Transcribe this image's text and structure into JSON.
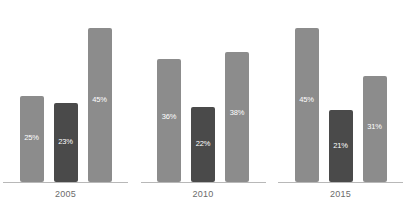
{
  "chart_data": {
    "type": "bar",
    "title": "",
    "subtitle": "",
    "xlabel": "",
    "ylabel": "",
    "ylim": [
      0,
      50
    ],
    "grid": false,
    "legend_position": "none",
    "categories": [
      "2005",
      "2010",
      "2015"
    ],
    "series": [
      {
        "name": "Series 1",
        "color": "#8c8c8c",
        "values": [
          25,
          36,
          45
        ]
      },
      {
        "name": "Series 2",
        "color": "#4a4a4a",
        "values": [
          23,
          22,
          21
        ]
      },
      {
        "name": "Series 3",
        "color": "#8c8c8c",
        "values": [
          45,
          38,
          31
        ]
      }
    ],
    "data_labels": [
      [
        "25%",
        "23%",
        "45%"
      ],
      [
        "36%",
        "22%",
        "38%"
      ],
      [
        "45%",
        "21%",
        "31%"
      ]
    ]
  },
  "groups": [
    {
      "year": "2005",
      "bars": [
        {
          "label": "25%",
          "value": 25,
          "color": "#8c8c8c",
          "tone": "light"
        },
        {
          "label": "23%",
          "value": 23,
          "color": "#4a4a4a",
          "tone": "dark"
        },
        {
          "label": "45%",
          "value": 45,
          "color": "#8c8c8c",
          "tone": "light"
        }
      ]
    },
    {
      "year": "2010",
      "bars": [
        {
          "label": "36%",
          "value": 36,
          "color": "#8c8c8c",
          "tone": "light"
        },
        {
          "label": "22%",
          "value": 22,
          "color": "#4a4a4a",
          "tone": "dark"
        },
        {
          "label": "38%",
          "value": 38,
          "color": "#8c8c8c",
          "tone": "light"
        }
      ]
    },
    {
      "year": "2015",
      "bars": [
        {
          "label": "45%",
          "value": 45,
          "color": "#8c8c8c",
          "tone": "light"
        },
        {
          "label": "21%",
          "value": 21,
          "color": "#4a4a4a",
          "tone": "dark"
        },
        {
          "label": "31%",
          "value": 31,
          "color": "#8c8c8c",
          "tone": "light"
        }
      ]
    }
  ],
  "colors": {
    "light_bar": "#8c8c8c",
    "dark_bar": "#4a4a4a",
    "baseline": "#b8b8b8",
    "year_text": "#6b6b6b",
    "label_text": "#ffffff",
    "background": "#ffffff"
  }
}
